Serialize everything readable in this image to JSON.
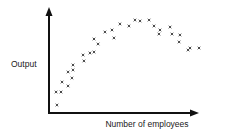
{
  "chart_data": {
    "type": "scatter",
    "title": "",
    "xlabel": "Number of employees",
    "ylabel": "Output",
    "xlim": [
      0,
      100
    ],
    "ylim": [
      0,
      100
    ],
    "grid": false,
    "ticks": "none",
    "axis_arrows": true,
    "marker": "x",
    "color": "#333333",
    "points": [
      {
        "x": 5.3,
        "y": 7.5
      },
      {
        "x": 4.7,
        "y": 19.8
      },
      {
        "x": 8.0,
        "y": 19.8
      },
      {
        "x": 8.7,
        "y": 29.2
      },
      {
        "x": 12.7,
        "y": 25.5
      },
      {
        "x": 12.7,
        "y": 38.7
      },
      {
        "x": 15.3,
        "y": 33.0
      },
      {
        "x": 16.0,
        "y": 40.6
      },
      {
        "x": 16.0,
        "y": 45.3
      },
      {
        "x": 23.3,
        "y": 49.1
      },
      {
        "x": 22.7,
        "y": 54.7
      },
      {
        "x": 27.3,
        "y": 56.6
      },
      {
        "x": 30.0,
        "y": 57.5
      },
      {
        "x": 30.0,
        "y": 69.8
      },
      {
        "x": 32.7,
        "y": 65.1
      },
      {
        "x": 37.3,
        "y": 76.4
      },
      {
        "x": 42.0,
        "y": 78.3
      },
      {
        "x": 43.3,
        "y": 70.8
      },
      {
        "x": 47.3,
        "y": 84.0
      },
      {
        "x": 53.3,
        "y": 82.1
      },
      {
        "x": 57.3,
        "y": 87.7
      },
      {
        "x": 60.7,
        "y": 86.8
      },
      {
        "x": 66.7,
        "y": 87.7
      },
      {
        "x": 70.0,
        "y": 82.1
      },
      {
        "x": 74.0,
        "y": 78.3
      },
      {
        "x": 73.3,
        "y": 74.5
      },
      {
        "x": 80.7,
        "y": 81.1
      },
      {
        "x": 82.0,
        "y": 74.5
      },
      {
        "x": 87.3,
        "y": 73.6
      },
      {
        "x": 86.7,
        "y": 67.0
      },
      {
        "x": 94.0,
        "y": 61.3
      },
      {
        "x": 92.7,
        "y": 59.4
      },
      {
        "x": 100.0,
        "y": 61.3
      }
    ]
  }
}
